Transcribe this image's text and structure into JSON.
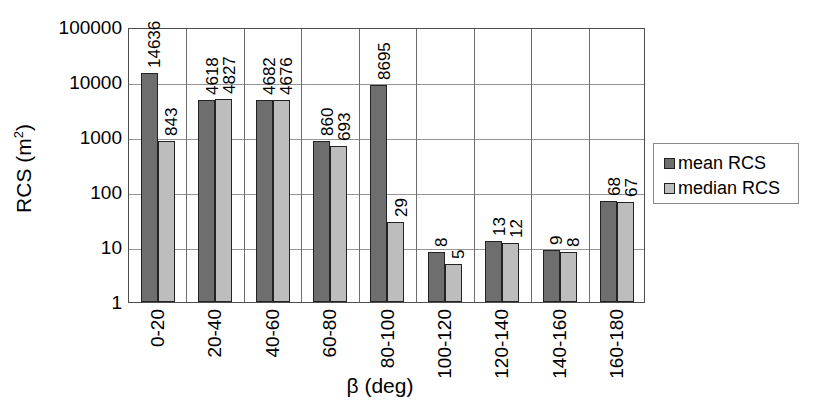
{
  "chart_data": {
    "type": "bar",
    "title": "",
    "subtitle": "",
    "xlabel": "β (deg)",
    "ylabel": "RCS (m²)",
    "yscale": "log",
    "ylim": [
      1,
      100000
    ],
    "ytick_labels": [
      "100000",
      "10000",
      "1000",
      "100",
      "10",
      "1"
    ],
    "ytick_values": [
      100000,
      10000,
      1000,
      100,
      10,
      1
    ],
    "grid": true,
    "legend_position": "right",
    "categories": [
      "0-20",
      "20-40",
      "40-60",
      "60-80",
      "80-100",
      "100-120",
      "120-140",
      "140-160",
      "160-180"
    ],
    "series": [
      {
        "name": "mean RCS",
        "color": "#6e6e6e",
        "values": [
          14636,
          4618,
          4682,
          860,
          8695,
          8,
          13,
          9,
          68
        ],
        "labels": [
          "14636",
          "4618",
          "4682",
          "860",
          "8695",
          "8",
          "13",
          "9",
          "68"
        ]
      },
      {
        "name": "median RCS",
        "color": "#bdbdbd",
        "values": [
          843,
          4827,
          4676,
          693,
          29,
          5,
          12,
          8,
          67
        ],
        "labels": [
          "843",
          "4827",
          "4676",
          "693",
          "29",
          "5",
          "12",
          "8",
          "67"
        ]
      }
    ]
  },
  "axes": {
    "y_title": "RCS (m",
    "y_title_sup": "2",
    "y_title_close": ")",
    "x_title": "β (deg)"
  },
  "legend": {
    "entries": [
      {
        "label": "mean RCS",
        "swatch": "mean"
      },
      {
        "label": "median RCS",
        "swatch": "median"
      }
    ]
  },
  "colors": {
    "mean": "#6e6e6e",
    "median": "#bdbdbd",
    "grid": "#959595",
    "axis": "#4d4d4d",
    "background": "#ffffff"
  }
}
